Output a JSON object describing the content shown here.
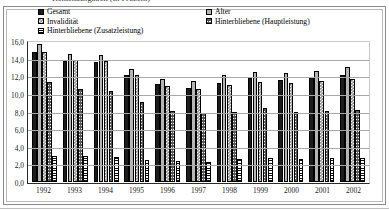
{
  "figure": {
    "title_clipped": "Rentenausgaben (in Prozent)",
    "frame": true
  },
  "legend": {
    "position": "top-inside",
    "columns": [
      {
        "entries": [
          {
            "label": "Gesamt",
            "swatch": "solid-black",
            "color": "#1c1c1c"
          },
          {
            "label": "Invalidität",
            "swatch": "checkerboard-gray",
            "color": "#8d8d8d"
          },
          {
            "label": "Hinterbliebene (Zusatzleistung)",
            "swatch": "horizontal-lines",
            "color": "#ffffff"
          }
        ]
      },
      {
        "entries": [
          {
            "label": "Alter",
            "swatch": "solid-light-gray",
            "color": "#b5b5b5"
          },
          {
            "label": "Hinterbliebene (Hauptleistung)",
            "swatch": "cross-hatch-gray",
            "color": "#5a5a5a"
          }
        ]
      }
    ]
  },
  "axes": {
    "y_tick_labels": [
      "16,0",
      "14,0",
      "12,0",
      "10,0",
      "8,0",
      "6,0",
      "4,0",
      "2,0",
      "0,0"
    ],
    "x_tick_labels": [
      "1992",
      "1993",
      "1994",
      "1995",
      "1996",
      "1997",
      "1998",
      "1999",
      "2000",
      "2001",
      "2002"
    ]
  },
  "chart_data": {
    "type": "bar",
    "title": "Rentenausgaben (in Prozent)",
    "xlabel": "",
    "ylabel": "",
    "ylim": [
      0,
      16
    ],
    "ytick_step": 2,
    "grid": true,
    "legend_position": "top",
    "categories": [
      "1992",
      "1993",
      "1994",
      "1995",
      "1996",
      "1997",
      "1998",
      "1999",
      "2000",
      "2001",
      "2002"
    ],
    "series": [
      {
        "name": "Gesamt",
        "values": [
          14.7,
          13.7,
          13.6,
          12.1,
          11.1,
          10.7,
          11.2,
          11.8,
          11.6,
          11.9,
          12.2
        ]
      },
      {
        "name": "Alter",
        "values": [
          15.7,
          14.5,
          14.4,
          12.8,
          11.7,
          11.5,
          12.1,
          12.5,
          12.4,
          12.6,
          13.0
        ]
      },
      {
        "name": "Invalidität",
        "values": [
          14.8,
          13.9,
          13.7,
          12.1,
          10.9,
          10.6,
          11.0,
          11.4,
          11.2,
          11.5,
          11.7
        ]
      },
      {
        "name": "Hinterbliebene (Hauptleistung)",
        "values": [
          11.3,
          10.5,
          10.3,
          9.1,
          8.1,
          7.8,
          7.9,
          8.4,
          8.0,
          8.1,
          8.2
        ]
      },
      {
        "name": "Hinterbliebene (Zusatzleistung)",
        "values": [
          2.9,
          2.9,
          2.8,
          2.5,
          2.4,
          2.3,
          2.6,
          2.7,
          2.6,
          2.7,
          2.7
        ]
      }
    ]
  }
}
